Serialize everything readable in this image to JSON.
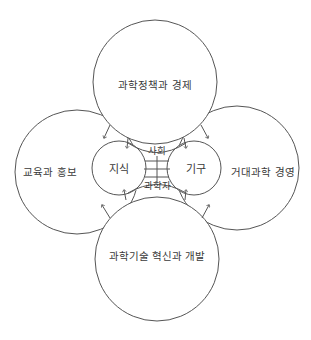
{
  "diagram": {
    "stroke_color": "#555555",
    "background": "#ffffff",
    "outer_circles": [
      {
        "id": "top",
        "label": "과학정책과 경제",
        "cx": 155,
        "cy": 82,
        "r": 62
      },
      {
        "id": "left",
        "label": "교육과 홍보",
        "cx": 77,
        "cy": 172,
        "r": 62
      },
      {
        "id": "right",
        "label": "거대과학 경영",
        "cx": 237,
        "cy": 168,
        "r": 62
      },
      {
        "id": "bottom",
        "label": "과학기술 혁신과 개발",
        "cx": 157,
        "cy": 259,
        "r": 62
      }
    ],
    "inner_circles": [
      {
        "id": "knowledge",
        "label": "지식",
        "cx": 119,
        "cy": 168,
        "r": 27
      },
      {
        "id": "institution",
        "label": "기구",
        "cx": 194,
        "cy": 168,
        "r": 27
      }
    ],
    "center_labels": {
      "society": "사회",
      "scientist": "과학자"
    }
  }
}
